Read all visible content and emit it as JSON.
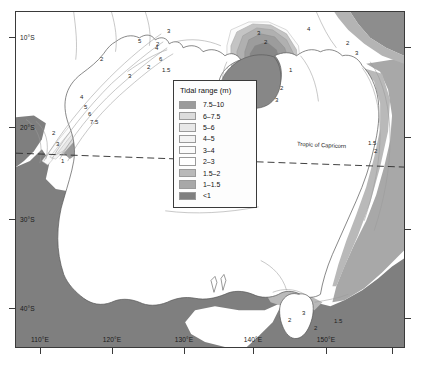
{
  "figure": {
    "kind": "thematic-map",
    "region": "Australia",
    "background_color": "#ffffff",
    "frame_color": "#3a3a3a"
  },
  "legend": {
    "title": "Tidal range (m)",
    "entries": [
      {
        "label": "7.5–10",
        "color": "#9a9a9a"
      },
      {
        "label": "6–7.5",
        "color": "#dcdcdc"
      },
      {
        "label": "5–6",
        "color": "#e8e8e8"
      },
      {
        "label": "4–5",
        "color": "#f3f3f3"
      },
      {
        "label": "3–4",
        "color": "#fbfbfb"
      },
      {
        "label": "2–3",
        "color": "#ffffff"
      },
      {
        "label": "1.5–2",
        "color": "#b9b9b9"
      },
      {
        "label": "1–1.5",
        "color": "#a8a8a8"
      },
      {
        "label": "<1",
        "color": "#7f7f7f"
      }
    ]
  },
  "axes": {
    "latitude_labels": [
      "10°S",
      "20°S",
      "30°S",
      "40°S"
    ],
    "longitude_labels": [
      "110°E",
      "120°E",
      "130°E",
      "140°E",
      "150°E"
    ]
  },
  "annotations": {
    "tropic_line": "Tropic of Capricorn"
  },
  "contour_labels": [
    {
      "value": "2",
      "x": 84,
      "y": 44
    },
    {
      "value": "2",
      "x": 140,
      "y": 29
    },
    {
      "value": "3",
      "x": 151,
      "y": 16
    },
    {
      "value": "4",
      "x": 139,
      "y": 33
    },
    {
      "value": "5",
      "x": 122,
      "y": 26
    },
    {
      "value": "6",
      "x": 143,
      "y": 44
    },
    {
      "value": "4",
      "x": 64,
      "y": 82
    },
    {
      "value": "5",
      "x": 68,
      "y": 92
    },
    {
      "value": "6",
      "x": 72,
      "y": 99
    },
    {
      "value": "7.5",
      "x": 74,
      "y": 107
    },
    {
      "value": "3",
      "x": 112,
      "y": 61
    },
    {
      "value": "2",
      "x": 131,
      "y": 52
    },
    {
      "value": "1.5",
      "x": 146,
      "y": 55
    },
    {
      "value": "3",
      "x": 241,
      "y": 18
    },
    {
      "value": "2",
      "x": 248,
      "y": 27
    },
    {
      "value": "1",
      "x": 273,
      "y": 55
    },
    {
      "value": "2",
      "x": 264,
      "y": 73
    },
    {
      "value": "3",
      "x": 259,
      "y": 85
    },
    {
      "value": "4",
      "x": 291,
      "y": 14
    },
    {
      "value": "2",
      "x": 330,
      "y": 28
    },
    {
      "value": "3",
      "x": 339,
      "y": 38
    },
    {
      "value": "1",
      "x": 45,
      "y": 146
    },
    {
      "value": "2",
      "x": 36,
      "y": 118
    },
    {
      "value": "3",
      "x": 40,
      "y": 129
    },
    {
      "value": "1.5",
      "x": 352,
      "y": 128
    },
    {
      "value": "2",
      "x": 358,
      "y": 136
    },
    {
      "value": "2",
      "x": 272,
      "y": 305
    },
    {
      "value": "3",
      "x": 286,
      "y": 298
    },
    {
      "value": "2",
      "x": 298,
      "y": 313
    },
    {
      "value": "1.5",
      "x": 318,
      "y": 306
    }
  ]
}
